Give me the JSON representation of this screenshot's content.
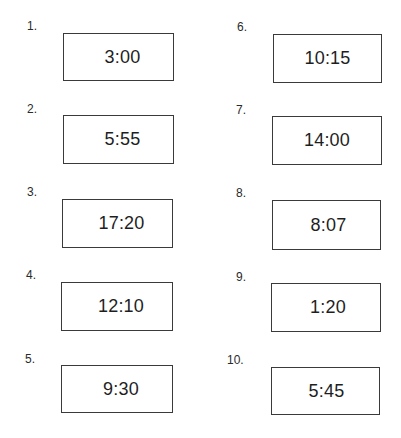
{
  "worksheet": {
    "items": [
      {
        "number": "1.",
        "time": "3:00"
      },
      {
        "number": "2.",
        "time": "5:55"
      },
      {
        "number": "3.",
        "time": "17:20"
      },
      {
        "number": "4.",
        "time": "12:10"
      },
      {
        "number": "5.",
        "time": "9:30"
      },
      {
        "number": "6.",
        "time": "10:15"
      },
      {
        "number": "7.",
        "time": "14:00"
      },
      {
        "number": "8.",
        "time": "8:07"
      },
      {
        "number": "9.",
        "time": "1:20"
      },
      {
        "number": "10.",
        "time": "5:45"
      }
    ]
  }
}
